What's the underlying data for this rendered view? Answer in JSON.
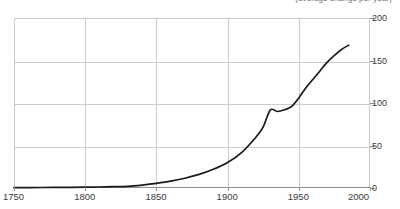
{
  "chart_data": {
    "type": "line",
    "title": "(average change per year)",
    "xlabel": "",
    "ylabel": "",
    "xlim": [
      1750,
      2000
    ],
    "ylim": [
      0,
      200
    ],
    "grid": true,
    "legend": null,
    "xticks": [
      1750,
      1800,
      1850,
      1900,
      1950,
      2000
    ],
    "yticks": [
      0,
      50,
      100,
      150,
      200
    ],
    "xtick_labels": [
      "1750",
      "1800",
      "1850",
      "1900",
      "1950",
      "2000"
    ],
    "ytick_labels": [
      "0",
      "50",
      "100",
      "150",
      "200"
    ],
    "series": [
      {
        "name": "value",
        "color": "#1a1a1a",
        "x": [
          1750,
          1770,
          1790,
          1800,
          1810,
          1820,
          1830,
          1840,
          1850,
          1860,
          1870,
          1880,
          1890,
          1900,
          1910,
          1920,
          1925,
          1930,
          1935,
          1940,
          1945,
          1950,
          1955,
          1960,
          1965,
          1970,
          1975,
          1980,
          1985
        ],
        "values": [
          0.5,
          0.6,
          0.8,
          1.0,
          1.2,
          1.5,
          2.0,
          3.5,
          5.5,
          8.0,
          11.5,
          16.0,
          22.0,
          30.0,
          42.0,
          60.0,
          72.0,
          92.0,
          90.0,
          92.0,
          96.0,
          106.0,
          118.0,
          128.0,
          138.0,
          148.0,
          156.0,
          163.0,
          168.0
        ]
      }
    ]
  },
  "axes": {
    "y": [
      {
        "label": "200",
        "value": 200
      },
      {
        "label": "150",
        "value": 150
      },
      {
        "label": "100",
        "value": 100
      },
      {
        "label": "50",
        "value": 50
      },
      {
        "label": "0",
        "value": 0
      }
    ],
    "x": [
      {
        "label": "1750",
        "value": 1750
      },
      {
        "label": "1800",
        "value": 1800
      },
      {
        "label": "1850",
        "value": 1850
      },
      {
        "label": "1900",
        "value": 1900
      },
      {
        "label": "1950",
        "value": 1950
      },
      {
        "label": "2000",
        "value": 2000
      }
    ]
  }
}
